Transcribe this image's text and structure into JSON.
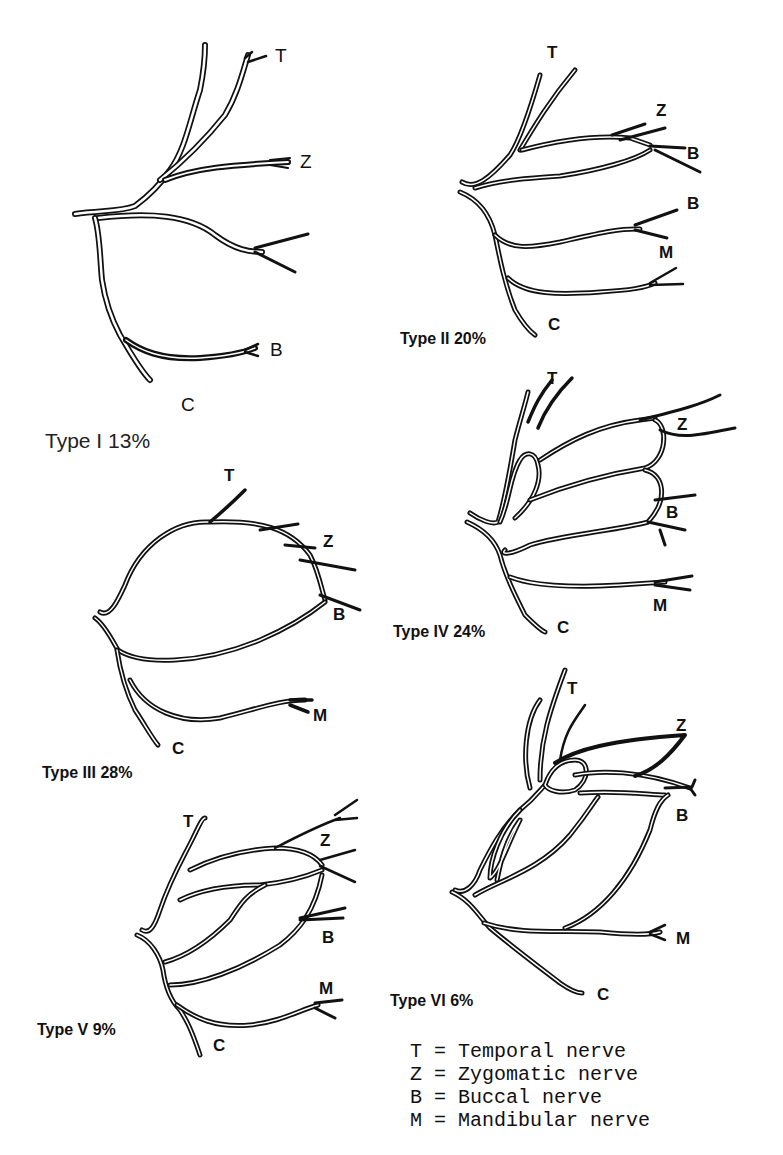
{
  "figure": {
    "panels": [
      {
        "id": "type-1",
        "caption": "Type I 13%",
        "type_label": "Type I",
        "percentage": "13%",
        "branch_labels": {
          "T": "T",
          "Z": "Z",
          "B": "B",
          "C": "C"
        }
      },
      {
        "id": "type-2",
        "caption": "Type II 20%",
        "type_label": "Type II",
        "percentage": "20%",
        "branch_labels": {
          "T": "T",
          "Z": "Z",
          "B1": "B",
          "B2": "B",
          "M": "M",
          "C": "C"
        }
      },
      {
        "id": "type-3",
        "caption": "Type III 28%",
        "type_label": "Type III",
        "percentage": "28%",
        "branch_labels": {
          "T": "T",
          "Z": "Z",
          "B": "B",
          "M": "M",
          "C": "C"
        }
      },
      {
        "id": "type-4",
        "caption": "Type IV 24%",
        "type_label": "Type IV",
        "percentage": "24%",
        "branch_labels": {
          "T": "T",
          "Z": "Z",
          "B": "B",
          "M": "M",
          "C": "C"
        }
      },
      {
        "id": "type-5",
        "caption": "Type V 9%",
        "type_label": "Type V",
        "percentage": "9%",
        "branch_labels": {
          "T": "T",
          "Z": "Z",
          "B": "B",
          "M": "M",
          "C": "C"
        }
      },
      {
        "id": "type-6",
        "caption": "Type VI 6%",
        "type_label": "Type VI",
        "percentage": "6%",
        "branch_labels": {
          "T": "T",
          "Z": "Z",
          "B": "B",
          "M": "M",
          "C": "C"
        }
      }
    ],
    "legend": [
      {
        "abbr": "T",
        "text": "T = Temporal nerve",
        "meaning": "Temporal nerve"
      },
      {
        "abbr": "Z",
        "text": "Z = Zygomatic nerve",
        "meaning": "Zygomatic nerve"
      },
      {
        "abbr": "B",
        "text": "B = Buccal nerve",
        "meaning": "Buccal nerve"
      },
      {
        "abbr": "M",
        "text": "M = Mandibular nerve",
        "meaning": "Mandibular nerve"
      }
    ]
  }
}
